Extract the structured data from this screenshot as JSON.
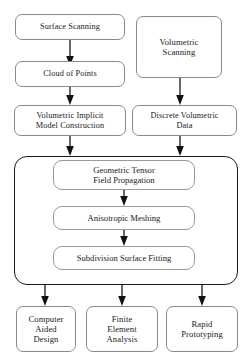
{
  "diagram": {
    "type": "flowchart",
    "canvas": {
      "width": 252,
      "height": 364,
      "background": "#ffffff"
    },
    "colors": {
      "node_border": "#8a8a8a",
      "group_border": "#1a1a1a",
      "arrow": "#111111",
      "text": "#1a1a1a",
      "background": "#ffffff"
    },
    "nodes": {
      "surface_scanning": "Surface Scanning",
      "volumetric_scanning": "Volumetric\nScanning",
      "cloud_of_points": "Cloud of Points",
      "volumetric_implicit": "Volumetric Implicit\nModel Construction",
      "discrete_volumetric": "Discrete Volumetric\nData",
      "geometric_tensor": "Geometric Tensor\nField Propagation",
      "anisotropic_meshing": "Anisotropic Meshing",
      "subdivision_fitting": "Subdivision Surface Fitting",
      "computer_aided_design": "Computer\nAided\nDesign",
      "finite_element_analysis": "Finite\nElement\nAnalysis",
      "rapid_prototyping": "Rapid\nPrototyping"
    },
    "edges": [
      {
        "from": "surface_scanning",
        "to": "cloud_of_points"
      },
      {
        "from": "cloud_of_points",
        "to": "volumetric_implicit"
      },
      {
        "from": "volumetric_scanning",
        "to": "discrete_volumetric"
      },
      {
        "from": "volumetric_implicit",
        "to": "core_group"
      },
      {
        "from": "discrete_volumetric",
        "to": "core_group"
      },
      {
        "from": "geometric_tensor",
        "to": "anisotropic_meshing"
      },
      {
        "from": "anisotropic_meshing",
        "to": "subdivision_fitting"
      },
      {
        "from": "core_group",
        "to": "computer_aided_design"
      },
      {
        "from": "core_group",
        "to": "finite_element_analysis"
      },
      {
        "from": "core_group",
        "to": "rapid_prototyping"
      }
    ]
  }
}
